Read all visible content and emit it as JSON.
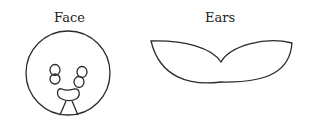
{
  "figures": [
    {
      "id": "face",
      "label": "Face"
    },
    {
      "id": "ears",
      "label": "Ears"
    }
  ],
  "colors": {
    "stroke": "#2a2a2a",
    "background": "#ffffff"
  }
}
